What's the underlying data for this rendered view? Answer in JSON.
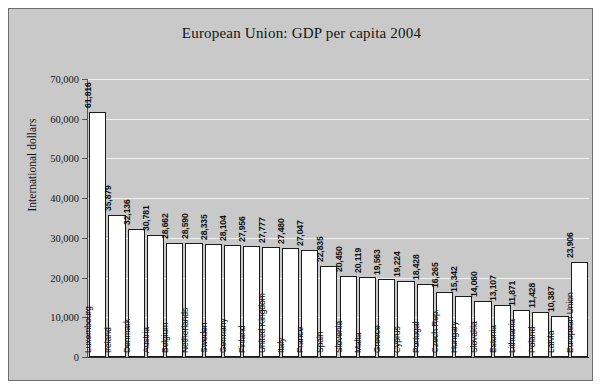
{
  "chart_data": {
    "type": "bar",
    "title": "European Union: GDP per capita 2004",
    "xlabel": "",
    "ylabel": "International dollars",
    "ylim": [
      0,
      70000
    ],
    "ytick_labels": [
      "70,000",
      "60,000",
      "50,000",
      "40,000",
      "30,000",
      "20,000",
      "10,000",
      "0"
    ],
    "ytick_values": [
      70000,
      60000,
      50000,
      40000,
      30000,
      20000,
      10000,
      0
    ],
    "grid": true,
    "legend": "none",
    "categories": [
      "Luxembourg",
      "Ireland",
      "Denmark",
      "Austria",
      "Belgium",
      "Netherlands",
      "Sweden",
      "Germany",
      "Finland",
      "United Kingdom",
      "Italy",
      "France",
      "Spain",
      "Slovenia",
      "Malta",
      "Greece",
      "Cyprus",
      "Portugal",
      "Czech Rep.",
      "Hungary",
      "Slovakia",
      "Estonia",
      "Lithuania",
      "Poland",
      "Latvia",
      "European Union"
    ],
    "values": [
      61816,
      35879,
      32136,
      30781,
      28662,
      28590,
      28335,
      28104,
      27956,
      27777,
      27480,
      27047,
      22835,
      20450,
      20119,
      19563,
      19224,
      18428,
      16265,
      15342,
      14060,
      13107,
      11871,
      11428,
      10387,
      23906
    ],
    "value_labels": [
      "61,816",
      "35,879",
      "32,136",
      "30,781",
      "28,662",
      "28,590",
      "28,335",
      "28,104",
      "27,956",
      "27,777",
      "27,480",
      "27,047",
      "22,835",
      "20,450",
      "20,119",
      "19,563",
      "19,224",
      "18,428",
      "16,265",
      "15,342",
      "14,060",
      "13,107",
      "11,871",
      "11,428",
      "10,387",
      "23,906"
    ]
  },
  "colors": {
    "figure_background": "#ffffff",
    "plot_background": "#c9c9c9",
    "bar_fill": "#ffffff",
    "bar_edge": "#1a1a1a",
    "gridline": "#f2f2f2",
    "text": "#141414"
  }
}
